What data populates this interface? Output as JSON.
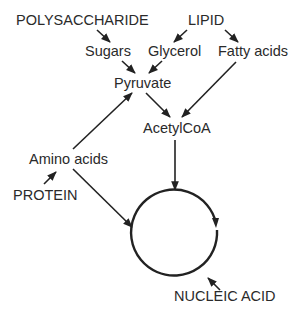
{
  "diagram": {
    "nodes": {
      "polysaccharide": "POLYSACCHARIDE",
      "lipid": "LIPID",
      "sugars": "Sugars",
      "glycerol": "Glycerol",
      "fatty_acids": "Fatty acids",
      "pyruvate": "Pyruvate",
      "acetylcoa": "AcetylCoA",
      "amino_acids": "Amino acids",
      "protein": "PROTEIN",
      "nucleic_acid": "NUCLEIC ACID"
    },
    "edges": [
      {
        "from": "POLYSACCHARIDE",
        "to": "Sugars"
      },
      {
        "from": "LIPID",
        "to": "Glycerol"
      },
      {
        "from": "LIPID",
        "to": "Fatty acids"
      },
      {
        "from": "Sugars",
        "to": "Pyruvate"
      },
      {
        "from": "Glycerol",
        "to": "Pyruvate"
      },
      {
        "from": "Fatty acids",
        "to": "AcetylCoA"
      },
      {
        "from": "Pyruvate",
        "to": "AcetylCoA"
      },
      {
        "from": "Amino acids",
        "to": "Pyruvate"
      },
      {
        "from": "PROTEIN",
        "to": "Amino acids"
      },
      {
        "from": "Amino acids",
        "to": "cycle"
      },
      {
        "from": "AcetylCoA",
        "to": "cycle"
      },
      {
        "from": "cycle",
        "to": "NUCLEIC ACID"
      }
    ],
    "colors": {
      "line": "#222222",
      "text": "#2a2a2a",
      "background": "#ffffff"
    }
  }
}
